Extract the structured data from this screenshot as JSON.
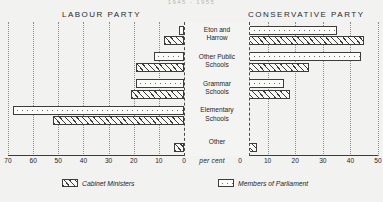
{
  "title": "1945 - 1955",
  "headings": {
    "left_party": "LABOUR PARTY",
    "right_party": "CONSERVATIVE PARTY"
  },
  "axis": {
    "unit_label": "per cent",
    "left_ticks": [
      70,
      60,
      50,
      40,
      30,
      20,
      10,
      0
    ],
    "right_ticks": [
      0,
      10,
      20,
      30,
      40,
      50
    ]
  },
  "legend": {
    "cabinet_label": "Cabinet Ministers",
    "mp_label": "Members of Parliament"
  },
  "colors": {
    "background": "#f2f2f0",
    "ink": "#3c3c3c",
    "label_panel": "#f4f4f2"
  },
  "chart_data": {
    "type": "bar",
    "title": "1945 - 1955",
    "xlabel": "per cent",
    "ylabel": "",
    "orientation": "horizontal",
    "layout": "diverging back-to-back, left = Labour Party, right = Conservative Party",
    "grid": "vertical dotted gridlines every 10 per cent",
    "legend_position": "bottom",
    "categories": [
      "Eton and Harrow",
      "Other Public Schools",
      "Grammar Schools",
      "Elementary Schools",
      "Other"
    ],
    "panels": [
      {
        "name": "LABOUR PARTY",
        "side": "left",
        "xlim": [
          0,
          70
        ],
        "series": [
          {
            "name": "Members of Parliament",
            "values": [
              2,
              12,
              19,
              68,
              0
            ]
          },
          {
            "name": "Cabinet Ministers",
            "values": [
              8,
              19,
              21,
              52,
              4
            ]
          }
        ]
      },
      {
        "name": "CONSERVATIVE PARTY",
        "side": "right",
        "xlim": [
          0,
          50
        ],
        "series": [
          {
            "name": "Members of Parliament",
            "values": [
              35,
              44,
              16,
              1,
              0
            ]
          },
          {
            "name": "Cabinet Ministers",
            "values": [
              45,
              25,
              18,
              3,
              6
            ]
          }
        ]
      }
    ]
  }
}
